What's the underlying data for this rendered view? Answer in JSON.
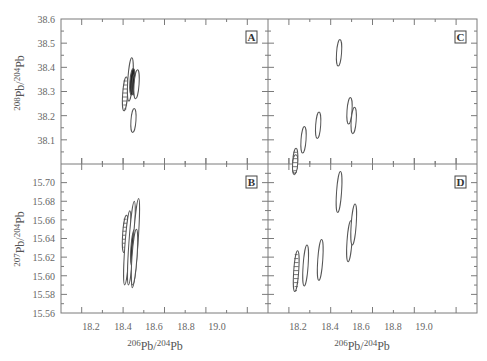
{
  "chart_data": {
    "type": "scatter",
    "title": "",
    "panels": [
      {
        "id": "A",
        "label": "A",
        "xlabel": "206Pb/204Pb",
        "ylabel": "208Pb/204Pb",
        "xlim": [
          18.1,
          19.1
        ],
        "ylim": [
          38.0,
          38.6
        ],
        "xticks": [
          18.2,
          18.4,
          18.6,
          18.8,
          19.0
        ],
        "yticks": [
          38.1,
          38.2,
          38.3,
          38.4,
          38.5,
          38.6
        ],
        "ellipses": [
          {
            "x": 18.41,
            "y": 38.29,
            "rx": 0.012,
            "ry": 0.07,
            "style": "hatched"
          },
          {
            "x": 18.435,
            "y": 38.35,
            "rx": 0.012,
            "ry": 0.09,
            "style": "open"
          },
          {
            "x": 18.445,
            "y": 38.34,
            "rx": 0.008,
            "ry": 0.055,
            "style": "filled"
          },
          {
            "x": 18.455,
            "y": 38.33,
            "rx": 0.008,
            "ry": 0.045,
            "style": "filled"
          },
          {
            "x": 18.465,
            "y": 38.33,
            "rx": 0.012,
            "ry": 0.06,
            "style": "open"
          },
          {
            "x": 18.45,
            "y": 38.18,
            "rx": 0.01,
            "ry": 0.05,
            "style": "open"
          }
        ]
      },
      {
        "id": "C",
        "label": "C",
        "xlabel": "206Pb/204Pb",
        "ylabel": "",
        "xlim": [
          18.1,
          19.1
        ],
        "ylim": [
          38.0,
          38.6
        ],
        "xticks": [
          18.2,
          18.4,
          18.6,
          18.8,
          19.0
        ],
        "yticks": [
          38.1,
          38.2,
          38.3,
          38.4,
          38.5,
          38.6
        ],
        "ellipses": [
          {
            "x": 18.23,
            "y": 38.01,
            "rx": 0.012,
            "ry": 0.055,
            "style": "hatched"
          },
          {
            "x": 18.27,
            "y": 38.1,
            "rx": 0.012,
            "ry": 0.055,
            "style": "open"
          },
          {
            "x": 18.34,
            "y": 38.16,
            "rx": 0.012,
            "ry": 0.055,
            "style": "open"
          },
          {
            "x": 18.44,
            "y": 38.46,
            "rx": 0.01,
            "ry": 0.055,
            "style": "open"
          },
          {
            "x": 18.49,
            "y": 38.22,
            "rx": 0.01,
            "ry": 0.055,
            "style": "open"
          },
          {
            "x": 18.51,
            "y": 38.18,
            "rx": 0.01,
            "ry": 0.055,
            "style": "open"
          }
        ]
      },
      {
        "id": "B",
        "label": "B",
        "xlabel": "206Pb/204Pb",
        "ylabel": "207Pb/204Pb",
        "xlim": [
          18.1,
          19.1
        ],
        "ylim": [
          15.56,
          15.72
        ],
        "xticks": [
          18.2,
          18.4,
          18.6,
          18.8,
          19.0
        ],
        "yticks": [
          15.56,
          15.58,
          15.6,
          15.62,
          15.64,
          15.66,
          15.68,
          15.7
        ],
        "ellipses": [
          {
            "x": 18.41,
            "y": 15.645,
            "rx": 0.012,
            "ry": 0.02,
            "style": "hatched"
          },
          {
            "x": 18.42,
            "y": 15.63,
            "rx": 0.012,
            "ry": 0.04,
            "style": "open"
          },
          {
            "x": 18.44,
            "y": 15.635,
            "rx": 0.012,
            "ry": 0.045,
            "style": "open"
          },
          {
            "x": 18.45,
            "y": 15.63,
            "rx": 0.008,
            "ry": 0.02,
            "style": "filled"
          },
          {
            "x": 18.46,
            "y": 15.635,
            "rx": 0.012,
            "ry": 0.048,
            "style": "open"
          },
          {
            "x": 18.455,
            "y": 15.62,
            "rx": 0.01,
            "ry": 0.03,
            "style": "open"
          }
        ]
      },
      {
        "id": "D",
        "label": "D",
        "xlabel": "206Pb/204Pb",
        "ylabel": "",
        "xlim": [
          18.1,
          19.1
        ],
        "ylim": [
          15.56,
          15.72
        ],
        "xticks": [
          18.2,
          18.4,
          18.6,
          18.8,
          19.0
        ],
        "yticks": [
          15.56,
          15.58,
          15.6,
          15.62,
          15.64,
          15.66,
          15.68,
          15.7
        ],
        "ellipses": [
          {
            "x": 18.23,
            "y": 15.72,
            "rx": 0.008,
            "ry": 0.01,
            "style": "hatched"
          },
          {
            "x": 18.235,
            "y": 15.605,
            "rx": 0.01,
            "ry": 0.022,
            "style": "hatched"
          },
          {
            "x": 18.28,
            "y": 15.611,
            "rx": 0.01,
            "ry": 0.022,
            "style": "open"
          },
          {
            "x": 18.35,
            "y": 15.617,
            "rx": 0.01,
            "ry": 0.022,
            "style": "open"
          },
          {
            "x": 18.44,
            "y": 15.69,
            "rx": 0.01,
            "ry": 0.022,
            "style": "open"
          },
          {
            "x": 18.49,
            "y": 15.637,
            "rx": 0.01,
            "ry": 0.022,
            "style": "open"
          },
          {
            "x": 18.51,
            "y": 15.655,
            "rx": 0.01,
            "ry": 0.022,
            "style": "open"
          }
        ]
      }
    ],
    "grid": false,
    "legend": null
  },
  "axes": {
    "x_tick_labels": [
      "18.2",
      "18.4",
      "18.6",
      "18.8",
      "19.0"
    ],
    "y_top_tick_labels": [
      "38.6",
      "38.5",
      "38.4",
      "38.3",
      "38.2",
      "38.1"
    ],
    "y_bottom_tick_labels": [
      "15.70",
      "15.68",
      "15.66",
      "15.64",
      "15.62",
      "15.60",
      "15.58",
      "15.56"
    ],
    "x_title": {
      "sup1": "206",
      "base1": "Pb/",
      "sup2": "204",
      "base2": "Pb"
    },
    "y_top_title": {
      "sup1": "208",
      "base1": "Pb/",
      "sup2": "204",
      "base2": "Pb"
    },
    "y_bottom_title": {
      "sup1": "207",
      "base1": "Pb/",
      "sup2": "204",
      "base2": "Pb"
    }
  },
  "colors": {
    "axis": "#7a7a7a",
    "ellipse": "#555555",
    "fill": "#222222"
  }
}
